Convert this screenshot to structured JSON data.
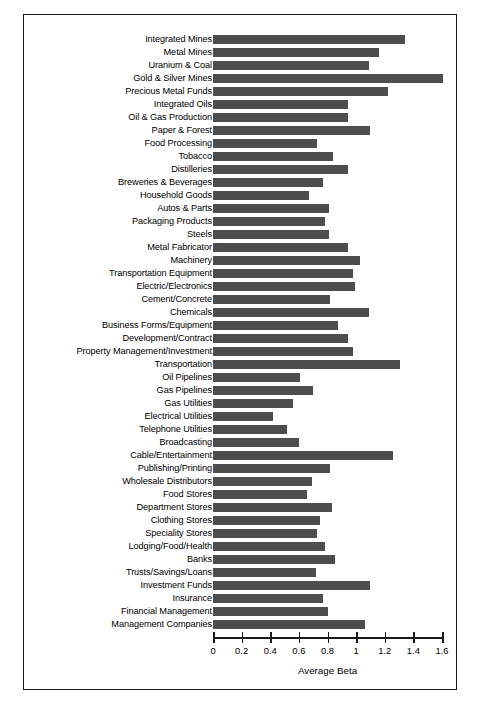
{
  "chart_data": {
    "type": "bar",
    "orientation": "horizontal",
    "title": "",
    "xlabel": "Average Beta",
    "ylabel": "",
    "xlim": [
      0,
      1.6
    ],
    "xticks": [
      "0",
      "0.2",
      "0.4",
      "0.6",
      "0.8",
      "1",
      "1.2",
      "1.4",
      "1.6"
    ],
    "xtick_values": [
      0,
      0.2,
      0.4,
      0.6,
      0.8,
      1.0,
      1.2,
      1.4,
      1.6
    ],
    "grid": false,
    "legend": null,
    "bar_color": "#4d4d4d",
    "frame_color": "#1a1a1a",
    "categories": [
      "Integrated Mines",
      "Metal Mines",
      "Uranium & Coal",
      "Gold & Silver Mines",
      "Precious Metal Funds",
      "Integrated Oils",
      "Oil & Gas Production",
      "Paper & Forest",
      "Food Processing",
      "Tobacco",
      "Distilleries",
      "Breweries & Beverages",
      "Household Goods",
      "Autos & Parts",
      "Packaging Products",
      "Steels",
      "Metal Fabricator",
      "Machinery",
      "Transportation Equipment",
      "Electric/Electronics",
      "Cement/Concrete",
      "Chemicals",
      "Business Forms/Equipment",
      "Development/Contract",
      "Property Management/Investment",
      "Transportation",
      "Oil Pipelines",
      "Gas Pipelines",
      "Gas Utilities",
      "Electrical Utilities",
      "Telephone Utilities",
      "Broadcasting",
      "Cable/Entertainment",
      "Publishing/Printing",
      "Wholesale Distributors",
      "Food Stores",
      "Department Stores",
      "Clothing Stores",
      "Speciality Stores",
      "Lodging/Food/Health",
      "Banks",
      "Trusts/Savings/Loans",
      "Investment Funds",
      "Insurance",
      "Financial Management",
      "Management Companies"
    ],
    "values": [
      1.34,
      1.16,
      1.09,
      1.61,
      1.22,
      0.94,
      0.94,
      1.1,
      0.73,
      0.84,
      0.94,
      0.77,
      0.67,
      0.81,
      0.78,
      0.81,
      0.94,
      1.03,
      0.98,
      0.99,
      0.82,
      1.09,
      0.87,
      0.94,
      0.98,
      1.31,
      0.61,
      0.7,
      0.56,
      0.42,
      0.52,
      0.6,
      1.26,
      0.82,
      0.69,
      0.66,
      0.83,
      0.75,
      0.73,
      0.78,
      0.85,
      0.72,
      1.1,
      0.77,
      0.8,
      1.06
    ]
  }
}
